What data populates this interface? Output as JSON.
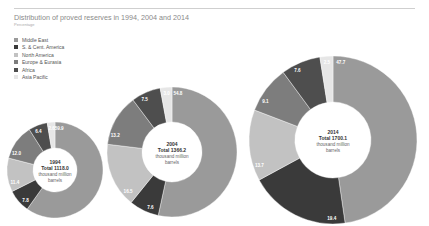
{
  "chart_data": {
    "type": "pie",
    "title": "Distribution of proved reserves in 1994, 2004 and 2014",
    "subtitle": "Percentage",
    "legend_position": "top-left",
    "categories": [
      "Middle East",
      "S. & Cent. America",
      "North America",
      "Europe & Eurasia",
      "Africa",
      "Asia Pacific"
    ],
    "colors": [
      "#9a9a9a",
      "#3a3a3a",
      "#c2c2c2",
      "#7d7d7d",
      "#4e4e4e",
      "#e6e6e6"
    ],
    "charts": [
      {
        "year": "1994",
        "total_label": "Total 1118.0",
        "unit_label_1": "thousand million",
        "unit_label_2": "barrels",
        "values": [
          59.9,
          7.8,
          11.4,
          12.0,
          6.4,
          2.6
        ],
        "labels": [
          "59.9",
          "7.8",
          "11.4",
          "12.0",
          "6.4",
          "2.6"
        ]
      },
      {
        "year": "2004",
        "total_label": "Total 1366.2",
        "unit_label_1": "thousand million",
        "unit_label_2": "barrels",
        "values": [
          54.8,
          7.6,
          16.5,
          13.2,
          7.5,
          3.0
        ],
        "labels": [
          "54.8",
          "7.6",
          "16.5",
          "13.2",
          "7.5",
          "3.0"
        ]
      },
      {
        "year": "2014",
        "total_label": "Total 1700.1",
        "unit_label_1": "thousand million",
        "unit_label_2": "barrels",
        "values": [
          47.7,
          19.4,
          13.7,
          9.1,
          7.6,
          2.5
        ],
        "labels": [
          "47.7",
          "19.4",
          "13.7",
          "9.1",
          "7.6",
          "2.5"
        ]
      }
    ]
  },
  "header": {
    "title": "Distribution of proved reserves in 1994, 2004 and 2014",
    "subtitle": "Percentage"
  },
  "legend": [
    {
      "label": "Middle East",
      "color": "#9a9a9a"
    },
    {
      "label": "S. & Cent. America",
      "color": "#3a3a3a"
    },
    {
      "label": "North America",
      "color": "#c2c2c2"
    },
    {
      "label": "Europe & Eurasia",
      "color": "#7d7d7d"
    },
    {
      "label": "Africa",
      "color": "#4e4e4e"
    },
    {
      "label": "Asia Pacific",
      "color": "#e6e6e6"
    }
  ]
}
